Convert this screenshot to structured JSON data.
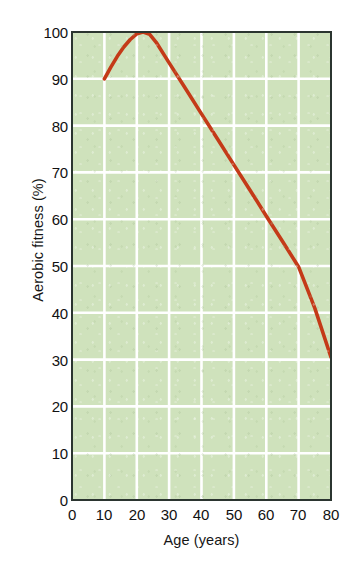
{
  "chart_data": {
    "type": "line",
    "title": "",
    "xlabel": "Age (years)",
    "ylabel": "Aerobic fitness (%)",
    "xlim": [
      0,
      80
    ],
    "ylim": [
      0,
      100
    ],
    "xticks": [
      0,
      10,
      20,
      30,
      40,
      50,
      60,
      70,
      80
    ],
    "yticks": [
      0,
      10,
      20,
      30,
      40,
      50,
      60,
      70,
      80,
      90,
      100
    ],
    "grid": true,
    "legend": "none",
    "plot_background_color": "#cfe2bc",
    "gridline_color": "#ffffff",
    "axis_color": "#2b3530",
    "series": [
      {
        "name": "Aerobic fitness",
        "color": "#c43a18",
        "x": [
          10,
          12,
          14,
          16,
          18,
          20,
          22,
          24,
          26,
          30,
          35,
          40,
          45,
          50,
          55,
          60,
          65,
          70,
          75,
          80
        ],
        "y": [
          90,
          92.5,
          94.8,
          96.8,
          98.4,
          99.6,
          100,
          99.5,
          97.8,
          93.4,
          88.0,
          82.5,
          77.1,
          71.6,
          66.2,
          60.7,
          55.3,
          49.8,
          41.0,
          30.5
        ]
      }
    ],
    "annotations": [
      {
        "text": "peak at age 22",
        "x": 22,
        "y": 100
      }
    ]
  },
  "axis": {
    "y_title": "Aerobic fitness (%)",
    "x_title": "Age (years)",
    "y_tick_labels": [
      "100",
      "90",
      "80",
      "70",
      "60",
      "50",
      "40",
      "30",
      "20",
      "10",
      "0"
    ],
    "x_tick_labels": [
      "0",
      "10",
      "20",
      "30",
      "40",
      "50",
      "60",
      "70",
      "80"
    ]
  }
}
